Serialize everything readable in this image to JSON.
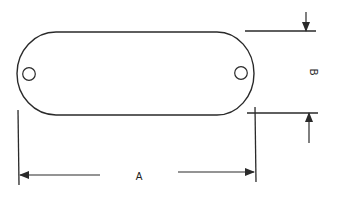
{
  "diagram": {
    "type": "dimensioned-slot-plate",
    "colors": {
      "stroke": "#2a2a2a",
      "background": "#ffffff"
    },
    "labels": {
      "width_dimension": "A",
      "height_dimension": "B"
    },
    "components": [
      {
        "name": "rounded-slot-outline",
        "description": "obround plate outline"
      },
      {
        "name": "left-hole",
        "description": "small circular hole near left end"
      },
      {
        "name": "right-hole",
        "description": "small circular hole near right end"
      }
    ],
    "dimensions": [
      {
        "label": "A",
        "orientation": "horizontal",
        "description": "overall length"
      },
      {
        "label": "B",
        "orientation": "vertical",
        "description": "overall height"
      }
    ]
  }
}
